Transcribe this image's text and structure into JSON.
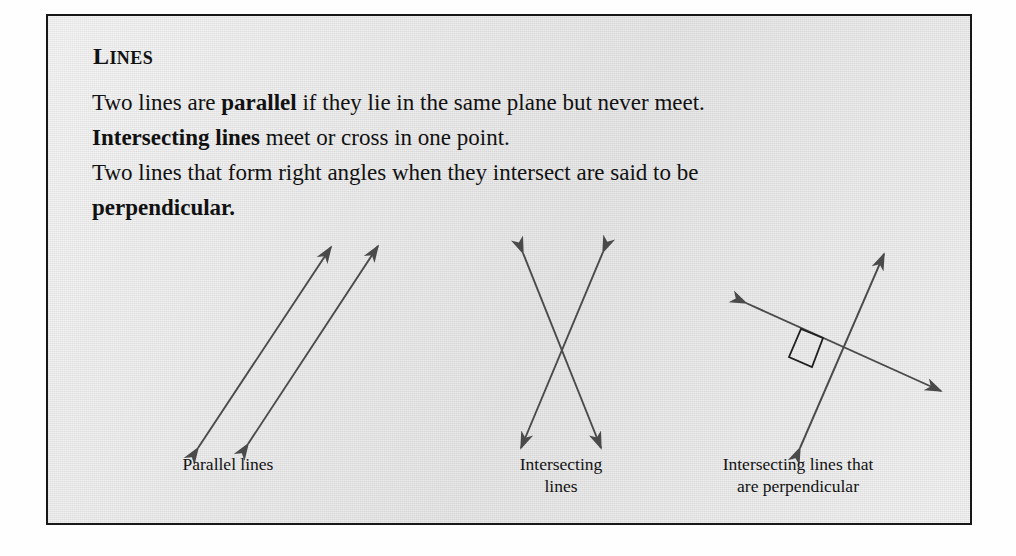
{
  "callout": {
    "heading": "LINES",
    "heading_first_letter": "L",
    "heading_rest": "INES",
    "border_color": "#181818",
    "background_color": "#e6e6e6",
    "text_color": "#111111",
    "line_color": "#4a4a4a"
  },
  "body": {
    "line1_a": "Two lines are ",
    "line1_b": "parallel",
    "line1_c": " if they lie in the same plane but never meet.",
    "line2_a": "Intersecting lines",
    "line2_b": " meet or cross in one point.",
    "line3_a": "Two lines that form right angles when they intersect are said to be",
    "line4_a": "perpendicular."
  },
  "figures": [
    {
      "id": "parallel",
      "caption": "Parallel lines",
      "kind": "two-parallel-double-headed-arrows",
      "arrow_ends": 2,
      "lines": [
        {
          "x1": 30,
          "y1": 232,
          "x2": 163,
          "y2": 31
        },
        {
          "x1": 80,
          "y1": 228,
          "x2": 210,
          "y2": 30
        }
      ]
    },
    {
      "id": "intersecting",
      "caption": "Intersecting\nlines",
      "kind": "two-crossing-double-headed-arrows",
      "arrow_ends": 2,
      "lines": [
        {
          "x1": 27,
          "y1": 37,
          "x2": 105,
          "y2": 232
        },
        {
          "x1": 107,
          "y1": 36,
          "x2": 25,
          "y2": 232
        }
      ]
    },
    {
      "id": "perpendicular",
      "caption": "Intersecting lines that\nare perpendicular",
      "kind": "two-perpendicular-double-headed-arrows-with-right-angle-mark",
      "arrow_ends": 2,
      "right_angle_marker": true,
      "intersection": {
        "x": 155,
        "y": 132
      },
      "lines": [
        {
          "x1": 58,
          "y1": 87,
          "x2": 253,
          "y2": 175
        },
        {
          "x1": 112,
          "y1": 232,
          "x2": 196,
          "y2": 38
        }
      ]
    }
  ]
}
